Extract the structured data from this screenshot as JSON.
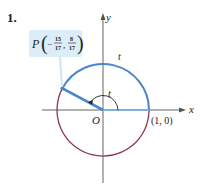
{
  "problem_number": "1.",
  "point_label": {
    "name": "P",
    "x_num": "15",
    "x_den": "17",
    "x_sign": "−",
    "y_num": "8",
    "y_den": "17"
  },
  "axes": {
    "x_label": "x",
    "y_label": "y"
  },
  "origin_label": "O",
  "unit_point_label": "(1, 0)",
  "arc_label": "t",
  "angle_label": "t",
  "colors": {
    "positive_arc": "#4a86c8",
    "remaining_arc": "#8b3a46",
    "axis": "#555555",
    "label_box": "#dbeef7"
  },
  "geometry": {
    "origin": [
      103,
      110
    ],
    "radius": 46,
    "point_P": [
      -0.882,
      0.471
    ]
  }
}
